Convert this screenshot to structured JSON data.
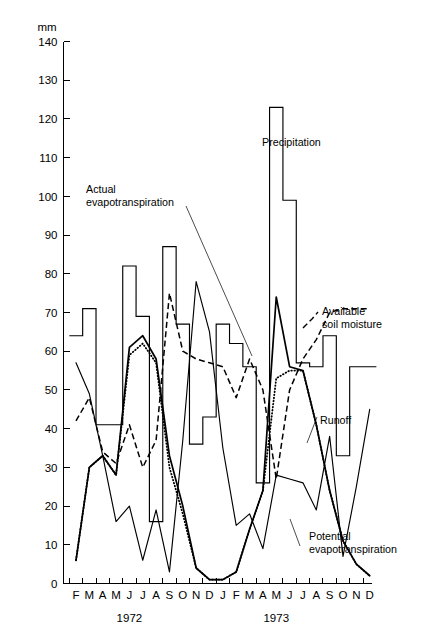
{
  "chart_data": {
    "type": "line",
    "title": "",
    "subtitle": "",
    "unit_label": "mm",
    "ylabel": "mm",
    "xlabel": "",
    "ylim": [
      0,
      140
    ],
    "y_ticks": [
      0,
      10,
      20,
      30,
      40,
      50,
      60,
      70,
      80,
      90,
      100,
      110,
      120,
      130,
      140
    ],
    "grid": false,
    "legend_position": "in-plot annotations",
    "x_tick_labels": [
      "F",
      "M",
      "A",
      "M",
      "J",
      "J",
      "A",
      "S",
      "O",
      "N",
      "D",
      "J",
      "F",
      "M",
      "A",
      "M",
      "J",
      "J",
      "A",
      "S",
      "O",
      "N",
      "D"
    ],
    "x_categories": [
      "1972-02",
      "1972-03",
      "1972-04",
      "1972-05",
      "1972-06",
      "1972-07",
      "1972-08",
      "1972-09",
      "1972-10",
      "1972-11",
      "1972-12",
      "1973-01",
      "1973-02",
      "1973-03",
      "1973-04",
      "1973-05",
      "1973-06",
      "1973-07",
      "1973-08",
      "1973-09",
      "1973-10",
      "1973-11",
      "1973-12"
    ],
    "year_groups": [
      {
        "label": "1972",
        "center_index": 4
      },
      {
        "label": "1973",
        "center_index": 15
      }
    ],
    "series": [
      {
        "name": "Precipitation",
        "style": "step-histogram",
        "values": [
          64,
          71,
          41,
          41,
          82,
          69,
          16,
          87,
          67,
          36,
          43,
          67,
          62,
          56,
          26,
          123,
          99,
          57,
          56,
          64,
          33,
          56,
          56
        ]
      },
      {
        "name": "Actual evapotranspiration",
        "style": "dotted",
        "values": [
          6,
          30,
          33,
          28,
          59,
          62,
          57,
          30,
          18,
          4,
          1,
          1,
          3,
          14,
          24,
          53,
          55,
          55,
          41,
          24,
          11,
          5,
          2
        ]
      },
      {
        "name": "Potential evapotranspiration",
        "style": "thick-solid",
        "values": [
          6,
          30,
          33,
          28,
          61,
          64,
          58,
          33,
          20,
          4,
          1,
          1,
          3,
          14,
          24,
          74,
          56,
          55,
          41,
          24,
          11,
          5,
          2
        ]
      },
      {
        "name": "Available soil moisture",
        "style": "dashed",
        "values": [
          42,
          48,
          34,
          31,
          41,
          30,
          37,
          75,
          60,
          58,
          57,
          56,
          48,
          58,
          50,
          27,
          50,
          58,
          63,
          70,
          71,
          71,
          71
        ]
      },
      {
        "name": "Runoff",
        "style": "thin-solid",
        "values": [
          57,
          49,
          33,
          16,
          20,
          6,
          19,
          3,
          37,
          78,
          65,
          35,
          15,
          18,
          9,
          28,
          27,
          26,
          19,
          38,
          7,
          25,
          45
        ]
      }
    ],
    "annotations": [
      {
        "name": "precipitation",
        "text": "Precipitation",
        "lines": [
          "Precipitation"
        ],
        "x": 262,
        "y": 146
      },
      {
        "name": "actual-evapotranspiration",
        "text": "Actual evapotranspiration",
        "lines": [
          "Actual",
          "evapotranspiration"
        ],
        "x": 86,
        "y": 193
      },
      {
        "name": "available-soil-moisture",
        "text": "Available soil moisture",
        "lines": [
          "Available",
          "soil moisture"
        ],
        "x": 322,
        "y": 315
      },
      {
        "name": "runoff",
        "text": "Runoff",
        "lines": [
          "Runoff"
        ],
        "x": 320,
        "y": 424
      },
      {
        "name": "potential-evapotranspiration",
        "text": "Potential evapotranspiration",
        "lines": [
          "Potential",
          "evapotranspiration"
        ],
        "x": 309,
        "y": 540
      }
    ]
  },
  "axes": {
    "unit": "mm",
    "y_tick_labels": [
      "0",
      "10",
      "20",
      "30",
      "40",
      "50",
      "60",
      "70",
      "80",
      "90",
      "100",
      "110",
      "120",
      "130",
      "140"
    ],
    "x_tick_labels": [
      "F",
      "M",
      "A",
      "M",
      "J",
      "J",
      "A",
      "S",
      "O",
      "N",
      "D",
      "J",
      "F",
      "M",
      "A",
      "M",
      "J",
      "J",
      "A",
      "S",
      "O",
      "N",
      "D"
    ],
    "years": [
      "1972",
      "1973"
    ]
  },
  "colors": {
    "ink": "#000000",
    "background": "#ffffff"
  }
}
